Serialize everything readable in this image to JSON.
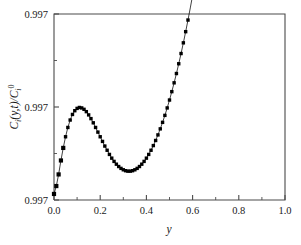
{
  "chart_data": {
    "type": "scatter",
    "title": "",
    "subtitle": "",
    "xlabel": "y",
    "ylabel": "Ci(y,t)/Ci0",
    "ylabel_parts": {
      "base1": "C",
      "sub1": "i",
      "mid": "(y,t)/C",
      "sub2": "i",
      "sup2": "0"
    },
    "xlim": [
      0.0,
      1.0
    ],
    "ylim": [
      0.997,
      0.9974
    ],
    "grid": false,
    "legend": null,
    "legend_position": "none",
    "marker_style": "filled-square",
    "marker_color": "#000000",
    "line_color": "#000000",
    "axis_color": "#4a4a4a",
    "xticks": [
      "0.0",
      "0.2",
      "0.4",
      "0.6",
      "0.8",
      "1.0"
    ],
    "xtick_values": [
      0.0,
      0.2,
      0.4,
      0.6,
      0.8,
      1.0
    ],
    "yticks": [
      "0.997",
      "0.997",
      "0.997"
    ],
    "ytick_values": [
      0.997,
      0.9972,
      0.9974
    ],
    "x_minor_count": 1,
    "y_minor_count": 1,
    "annotations": [],
    "x": [
      0.0,
      0.01,
      0.02,
      0.03,
      0.04,
      0.05,
      0.06,
      0.07,
      0.08,
      0.09,
      0.1,
      0.11,
      0.12,
      0.13,
      0.14,
      0.15,
      0.16,
      0.17,
      0.18,
      0.19,
      0.2,
      0.21,
      0.22,
      0.23,
      0.24,
      0.25,
      0.26,
      0.27,
      0.28,
      0.29,
      0.3,
      0.31,
      0.32,
      0.33,
      0.34,
      0.35,
      0.36,
      0.37,
      0.38,
      0.39,
      0.4,
      0.41,
      0.42,
      0.43,
      0.44,
      0.45,
      0.46,
      0.47,
      0.48,
      0.49,
      0.5,
      0.51,
      0.52,
      0.53,
      0.54,
      0.55,
      0.56,
      0.57,
      0.58,
      0.59,
      0.6,
      0.61,
      0.62,
      0.63,
      0.64,
      0.65,
      0.66,
      0.67,
      0.68,
      0.69,
      0.7,
      0.71,
      0.72,
      0.73,
      0.74,
      0.75,
      0.76,
      0.77,
      0.78,
      0.79,
      0.8,
      0.81,
      0.82,
      0.83,
      0.84,
      0.85,
      0.86
    ],
    "y": [
      0.997013,
      0.99703,
      0.997055,
      0.997085,
      0.997112,
      0.997136,
      0.997156,
      0.997172,
      0.997184,
      0.997192,
      0.997197,
      0.997199,
      0.997198,
      0.997195,
      0.99719,
      0.997183,
      0.997175,
      0.997166,
      0.997156,
      0.997146,
      0.997136,
      0.997126,
      0.997116,
      0.997107,
      0.997098,
      0.99709,
      0.997083,
      0.997077,
      0.997072,
      0.997068,
      0.997065,
      0.997063,
      0.997062,
      0.997062,
      0.997063,
      0.997065,
      0.997068,
      0.997072,
      0.997077,
      0.997083,
      0.99709,
      0.997098,
      0.997107,
      0.997117,
      0.997128,
      0.99714,
      0.997153,
      0.997167,
      0.997182,
      0.997198,
      0.997215,
      0.997233,
      0.997252,
      0.997272,
      0.997293,
      0.997315,
      0.997338,
      0.997362,
      0.997387,
      0.997413,
      0.99744,
      0.997468,
      0.997497,
      0.997527,
      0.997558,
      0.99759,
      0.997623,
      0.997657,
      0.997692,
      0.997728,
      0.997765,
      0.997803,
      0.997842,
      0.997882,
      0.997923,
      0.997965,
      0.998008,
      0.998052,
      0.998097,
      0.998143,
      0.99819,
      0.998238,
      0.998287,
      0.998337,
      0.998388,
      0.99844,
      0.998493
    ],
    "marker_sampling_note": "Markers drawn at every data point; large spacing near y=0 where the curve is steep, dense elsewhere."
  }
}
